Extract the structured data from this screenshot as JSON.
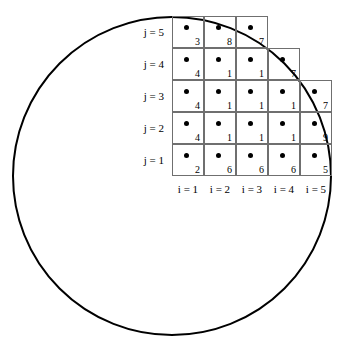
{
  "figure": {
    "type": "lattice-over-circle-diagram",
    "background": "#ffffff",
    "stroke_color": "#000000",
    "grid_line_color": "#6f6f6f",
    "dot_color": "#000000"
  },
  "circle": {
    "name": "circle-outline",
    "center_x": 172,
    "center_y": 176,
    "radius": 159,
    "stroke_width": 2
  },
  "grid": {
    "origin_x": 172,
    "origin_y": 16,
    "cell_size": 32,
    "rows": [
      {
        "row_label": "j = 5",
        "j": 5,
        "cells": [
          {
            "i": 1,
            "value": "3"
          },
          {
            "i": 2,
            "value": "8"
          },
          {
            "i": 3,
            "value": "7"
          }
        ]
      },
      {
        "row_label": "j = 4",
        "j": 4,
        "cells": [
          {
            "i": 1,
            "value": "4"
          },
          {
            "i": 2,
            "value": "1"
          },
          {
            "i": 3,
            "value": "1"
          },
          {
            "i": 4,
            "value": "7"
          }
        ]
      },
      {
        "row_label": "j = 3",
        "j": 3,
        "cells": [
          {
            "i": 1,
            "value": "4"
          },
          {
            "i": 2,
            "value": "1"
          },
          {
            "i": 3,
            "value": "1"
          },
          {
            "i": 4,
            "value": "1"
          },
          {
            "i": 5,
            "value": "7"
          }
        ]
      },
      {
        "row_label": "j = 2",
        "j": 2,
        "cells": [
          {
            "i": 1,
            "value": "4"
          },
          {
            "i": 2,
            "value": "1"
          },
          {
            "i": 3,
            "value": "1"
          },
          {
            "i": 4,
            "value": "1"
          },
          {
            "i": 5,
            "value": "9"
          }
        ]
      },
      {
        "row_label": "j = 1",
        "j": 1,
        "cells": [
          {
            "i": 1,
            "value": "2"
          },
          {
            "i": 2,
            "value": "6"
          },
          {
            "i": 3,
            "value": "6"
          },
          {
            "i": 4,
            "value": "6"
          },
          {
            "i": 5,
            "value": "5"
          }
        ]
      }
    ],
    "column_labels": [
      "i = 1",
      "i = 2",
      "i = 3",
      "i = 4",
      "i = 5"
    ]
  },
  "chart_data": {
    "type": "heatmap",
    "title": "",
    "xlabel": "i",
    "ylabel": "j",
    "x_tick_labels": [
      "i = 1",
      "i = 2",
      "i = 3",
      "i = 4",
      "i = 5"
    ],
    "y_tick_labels": [
      "j = 1",
      "j = 2",
      "j = 3",
      "j = 4",
      "j = 5"
    ],
    "x": [
      1,
      2,
      3,
      4,
      5
    ],
    "y": [
      1,
      2,
      3,
      4,
      5
    ],
    "grid": true,
    "legend": "none",
    "note": "Staircase lattice of unit cells inscribed under a circular arc; each cell carries a node dot and an integer label. Rows j=4 and j=5 are truncated by the arc.",
    "series": [
      {
        "name": "j = 5",
        "x": [
          1,
          2,
          3
        ],
        "values": [
          3,
          8,
          7
        ]
      },
      {
        "name": "j = 4",
        "x": [
          1,
          2,
          3,
          4
        ],
        "values": [
          4,
          1,
          1,
          7
        ]
      },
      {
        "name": "j = 3",
        "x": [
          1,
          2,
          3,
          4,
          5
        ],
        "values": [
          4,
          1,
          1,
          1,
          7
        ]
      },
      {
        "name": "j = 2",
        "x": [
          1,
          2,
          3,
          4,
          5
        ],
        "values": [
          4,
          1,
          1,
          1,
          9
        ]
      },
      {
        "name": "j = 1",
        "x": [
          1,
          2,
          3,
          4,
          5
        ],
        "values": [
          2,
          6,
          6,
          6,
          5
        ]
      }
    ]
  }
}
